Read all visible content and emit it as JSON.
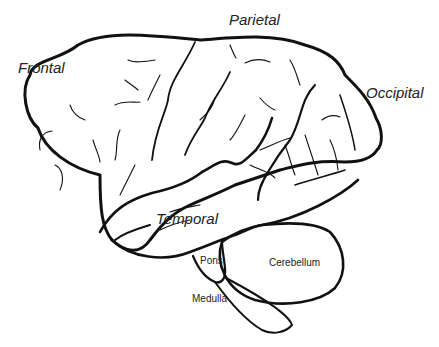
{
  "diagram": {
    "type": "anatomical line drawing",
    "labels": {
      "frontal": "Frontal",
      "parietal": "Parietal",
      "occipital": "Occipital",
      "temporal": "Temporal",
      "cerebellum": "Cerebellum",
      "pons": "Pons",
      "medulla": "Medulla"
    },
    "colors": {
      "stroke": "#111111",
      "text": "#222222",
      "background": "#ffffff"
    }
  }
}
